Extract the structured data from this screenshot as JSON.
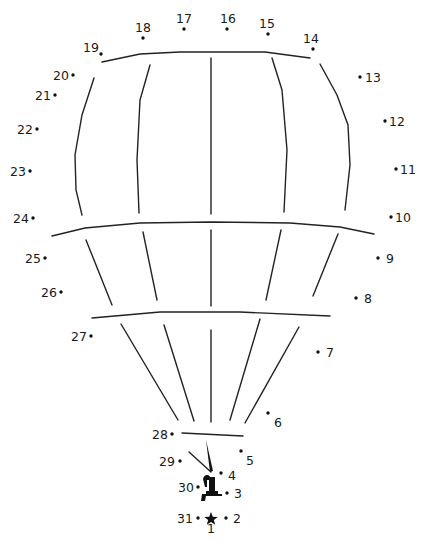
{
  "puzzle": {
    "title": "Hot air balloon dot-to-dot",
    "start_marker": "star-icon",
    "points": [
      {
        "n": "1",
        "label_side": "below"
      },
      {
        "n": "2",
        "label_side": "right"
      },
      {
        "n": "3",
        "label_side": "right"
      },
      {
        "n": "4",
        "label_side": "right"
      },
      {
        "n": "5",
        "label_side": "below-right"
      },
      {
        "n": "6",
        "label_side": "below-right"
      },
      {
        "n": "7",
        "label_side": "right"
      },
      {
        "n": "8",
        "label_side": "right"
      },
      {
        "n": "9",
        "label_side": "right"
      },
      {
        "n": "10",
        "label_side": "right"
      },
      {
        "n": "11",
        "label_side": "right"
      },
      {
        "n": "12",
        "label_side": "right"
      },
      {
        "n": "13",
        "label_side": "right"
      },
      {
        "n": "14",
        "label_side": "above"
      },
      {
        "n": "15",
        "label_side": "above"
      },
      {
        "n": "16",
        "label_side": "above"
      },
      {
        "n": "17",
        "label_side": "above"
      },
      {
        "n": "18",
        "label_side": "above"
      },
      {
        "n": "19",
        "label_side": "left"
      },
      {
        "n": "20",
        "label_side": "left"
      },
      {
        "n": "21",
        "label_side": "left"
      },
      {
        "n": "22",
        "label_side": "left"
      },
      {
        "n": "23",
        "label_side": "left"
      },
      {
        "n": "24",
        "label_side": "left"
      },
      {
        "n": "25",
        "label_side": "left"
      },
      {
        "n": "26",
        "label_side": "left"
      },
      {
        "n": "27",
        "label_side": "left"
      },
      {
        "n": "28",
        "label_side": "left"
      },
      {
        "n": "29",
        "label_side": "left"
      },
      {
        "n": "30",
        "label_side": "left"
      },
      {
        "n": "31",
        "label_side": "left"
      }
    ]
  }
}
